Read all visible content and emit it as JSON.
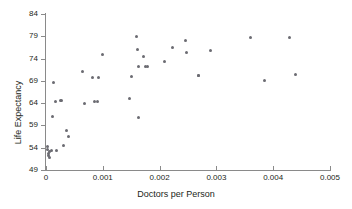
{
  "chart_data": {
    "type": "scatter",
    "title": "",
    "xlabel": "Doctors per Person",
    "ylabel": "Life Expectancy",
    "xlim": [
      0,
      0.005
    ],
    "ylim": [
      49,
      84
    ],
    "xticks": [
      "0",
      "0.001",
      "0.002",
      "0.003",
      "0.004",
      "0.005"
    ],
    "xtick_values": [
      0,
      0.001,
      0.002,
      0.003,
      0.004,
      0.005
    ],
    "yticks": [
      "49",
      "54",
      "59",
      "64",
      "69",
      "74",
      "79",
      "84"
    ],
    "ytick_values": [
      49,
      54,
      59,
      64,
      69,
      74,
      79,
      84
    ],
    "grid": false,
    "legend": null,
    "marker_color": "#6b6b72",
    "axis_color": "#8a8a8a",
    "points": [
      {
        "x": 2e-05,
        "y": 54.2
      },
      {
        "x": 3e-05,
        "y": 53.6
      },
      {
        "x": 4e-05,
        "y": 52.8
      },
      {
        "x": 5e-05,
        "y": 52.2
      },
      {
        "x": 6e-05,
        "y": 51.8
      },
      {
        "x": 7e-05,
        "y": 53.1
      },
      {
        "x": 9e-05,
        "y": 53.4
      },
      {
        "x": 0.00011,
        "y": 60.9
      },
      {
        "x": 0.00013,
        "y": 68.7
      },
      {
        "x": 0.00016,
        "y": 64.4
      },
      {
        "x": 0.00019,
        "y": 53.4
      },
      {
        "x": 0.00026,
        "y": 64.5
      },
      {
        "x": 0.00028,
        "y": 64.6
      },
      {
        "x": 0.0003,
        "y": 54.6
      },
      {
        "x": 0.00036,
        "y": 57.9
      },
      {
        "x": 0.0004,
        "y": 56.6
      },
      {
        "x": 0.00065,
        "y": 71.1
      },
      {
        "x": 0.00068,
        "y": 64.0
      },
      {
        "x": 0.00082,
        "y": 69.8
      },
      {
        "x": 0.00086,
        "y": 64.4
      },
      {
        "x": 0.0009,
        "y": 64.4
      },
      {
        "x": 0.00092,
        "y": 69.8
      },
      {
        "x": 0.001,
        "y": 75.0
      },
      {
        "x": 0.00147,
        "y": 65.1
      },
      {
        "x": 0.0015,
        "y": 69.9
      },
      {
        "x": 0.0016,
        "y": 79.0
      },
      {
        "x": 0.00161,
        "y": 76.0
      },
      {
        "x": 0.00162,
        "y": 72.3
      },
      {
        "x": 0.00163,
        "y": 60.8
      },
      {
        "x": 0.00172,
        "y": 74.5
      },
      {
        "x": 0.00175,
        "y": 72.3
      },
      {
        "x": 0.00178,
        "y": 72.3
      },
      {
        "x": 0.00208,
        "y": 73.3
      },
      {
        "x": 0.00222,
        "y": 76.5
      },
      {
        "x": 0.00246,
        "y": 78.0
      },
      {
        "x": 0.00248,
        "y": 75.4
      },
      {
        "x": 0.00268,
        "y": 70.3
      },
      {
        "x": 0.00269,
        "y": 70.1
      },
      {
        "x": 0.00289,
        "y": 75.8
      },
      {
        "x": 0.0036,
        "y": 78.8
      },
      {
        "x": 0.00385,
        "y": 69.1
      },
      {
        "x": 0.00428,
        "y": 78.8
      },
      {
        "x": 0.0044,
        "y": 70.4
      }
    ]
  }
}
